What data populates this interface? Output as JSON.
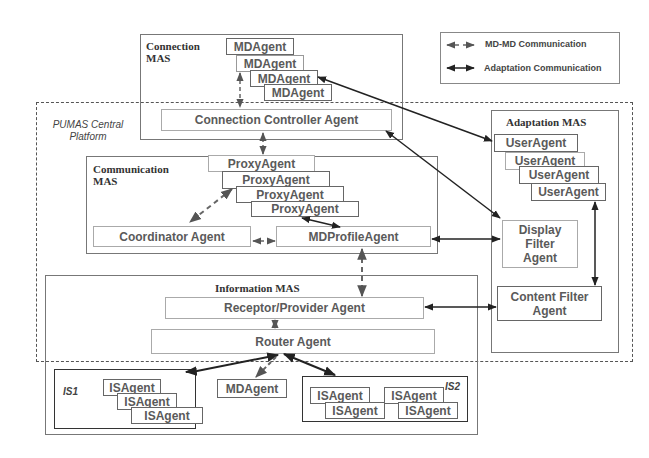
{
  "legend": {
    "items": [
      {
        "label": "MD-MD Communication",
        "style": "dashed"
      },
      {
        "label": "Adaptation Communication",
        "style": "solid"
      }
    ]
  },
  "platform": {
    "label_line1": "PUMAS Central",
    "label_line2": "Platform"
  },
  "connection_mas": {
    "title_line1": "Connection",
    "title_line2": "MAS",
    "md_agents": [
      "MDAgent",
      "MDAgent",
      "MDAgent",
      "MDAgent"
    ],
    "controller": "Connection Controller Agent"
  },
  "communication_mas": {
    "title_line1": "Communication",
    "title_line2": "MAS",
    "proxy_agents": [
      "ProxyAgent",
      "ProxyAgent",
      "ProxyAgent",
      "ProxyAgent"
    ],
    "coordinator": "Coordinator Agent",
    "md_profile": "MDProfileAgent"
  },
  "adaptation_mas": {
    "title": "Adaptation MAS",
    "user_agents": [
      "UserAgent",
      "UserAgent",
      "UserAgent",
      "UserAgent"
    ],
    "display_filter_line1": "Display",
    "display_filter_line2": "Filter",
    "display_filter_line3": "Agent",
    "content_filter_line1": "Content Filter",
    "content_filter_line2": "Agent"
  },
  "information_mas": {
    "title": "Information MAS",
    "receptor": "Receptor/Provider Agent",
    "router": "Router Agent",
    "md_agent": "MDAgent",
    "is1": {
      "label": "IS1",
      "agents": [
        "ISAgent",
        "ISAgent",
        "ISAgent"
      ]
    },
    "is2": {
      "label": "IS2",
      "agents": [
        "ISAgent",
        "ISAgent",
        "ISAgent",
        "ISAgent"
      ]
    }
  }
}
